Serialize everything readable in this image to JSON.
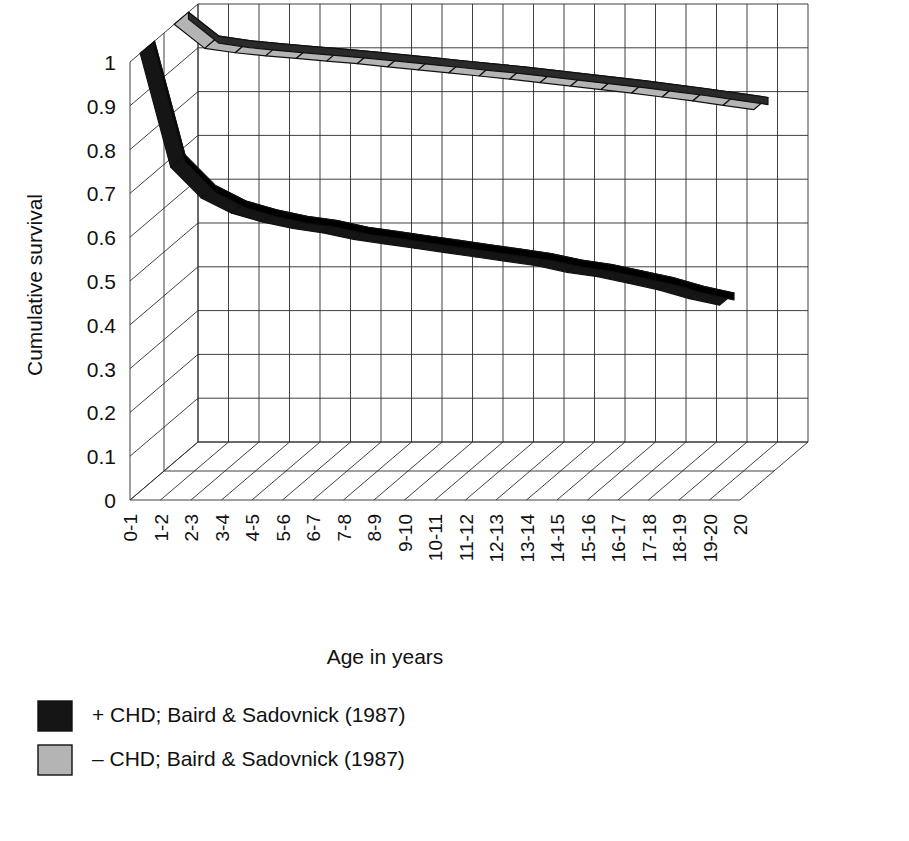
{
  "figure": {
    "background": "#ffffff",
    "ink": "#111111"
  },
  "chart_data": {
    "type": "line",
    "title": "",
    "subtitle": "",
    "xlabel": "Age in years",
    "ylabel": "Cumulative survival",
    "ylim": [
      0,
      1
    ],
    "yticks": [
      "0",
      "0.1",
      "0.2",
      "0.3",
      "0.4",
      "0.5",
      "0.6",
      "0.7",
      "0.8",
      "0.9",
      "1"
    ],
    "ytick_values": [
      0,
      0.1,
      0.2,
      0.3,
      0.4,
      0.5,
      0.6,
      0.7,
      0.8,
      0.9,
      1
    ],
    "grid": true,
    "projection": "3d-ribbon",
    "legend_position": "bottom-left",
    "categories": [
      "0-1",
      "1-2",
      "2-3",
      "3-4",
      "4-5",
      "5-6",
      "6-7",
      "7-8",
      "8-9",
      "9-10",
      "10-11",
      "11-12",
      "12-13",
      "13-14",
      "14-15",
      "15-16",
      "16-17",
      "17-18",
      "18-19",
      "19-20",
      "20"
    ],
    "series": [
      {
        "name": "+ CHD; Baird & Sadovnick (1987)",
        "key": "plus_chd",
        "color": "#151515",
        "fill": "#151515",
        "side_color": "#000000",
        "depth_index": 0,
        "values": [
          1.0,
          0.74,
          0.67,
          0.635,
          0.615,
          0.6,
          0.59,
          0.575,
          0.565,
          0.555,
          0.545,
          0.535,
          0.525,
          0.515,
          0.5,
          0.49,
          0.475,
          0.46,
          0.44,
          0.425,
          null
        ]
      },
      {
        "name": "– CHD; Baird & Sadovnick (1987)",
        "key": "minus_chd",
        "color": "#b4b4b4",
        "fill": "#b4b4b4",
        "side_color": "#2a2a2a",
        "depth_index": 1,
        "values": [
          1.0,
          0.945,
          0.935,
          0.928,
          0.922,
          0.916,
          0.91,
          0.903,
          0.896,
          0.889,
          0.882,
          0.875,
          0.867,
          0.859,
          0.851,
          0.843,
          0.834,
          0.825,
          0.815,
          0.805,
          null
        ]
      }
    ]
  },
  "legend": {
    "items": [
      {
        "label": "+ CHD; Baird & Sadovnick (1987)",
        "swatch": "#151515",
        "swatch_stroke": "#111111"
      },
      {
        "label": "– CHD; Baird & Sadovnick (1987)",
        "swatch": "#b4b4b4",
        "swatch_stroke": "#111111"
      }
    ]
  }
}
